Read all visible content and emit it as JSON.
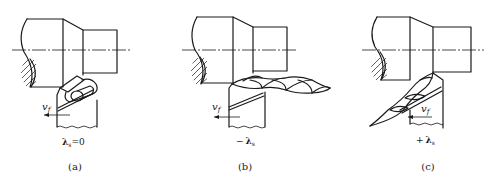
{
  "figure": {
    "panels": [
      {
        "id": "a",
        "caption": "(a)",
        "feed_label": "v",
        "feed_subscript": "f",
        "angle_label": "λ",
        "angle_subscript": "s",
        "angle_value": "=0",
        "chip_shape": "coiled chip flowing perpendicular to edge"
      },
      {
        "id": "b",
        "caption": "(b)",
        "feed_label": "v",
        "feed_subscript": "f",
        "angle_prefix": "−",
        "angle_label": "λ",
        "angle_subscript": "s",
        "chip_shape": "helical chip flowing toward machined surface"
      },
      {
        "id": "c",
        "caption": "(c)",
        "feed_label": "v",
        "feed_subscript": "f",
        "angle_prefix": "+",
        "angle_label": "λ",
        "angle_subscript": "s",
        "chip_shape": "helical chip flowing toward unmachined surface"
      }
    ]
  }
}
